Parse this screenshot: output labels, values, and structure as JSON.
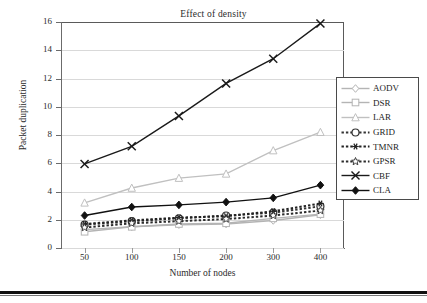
{
  "chart_data": {
    "type": "line",
    "title": "Effect of density",
    "xlabel": "Number of nodes",
    "ylabel": "Packet duplication",
    "categories": [
      "50",
      "100",
      "150",
      "200",
      "300",
      "400"
    ],
    "x_tick_labels": [
      "50",
      "100",
      "150",
      "200",
      "300",
      "400"
    ],
    "y_tick_labels": [
      "0",
      "2",
      "4",
      "6",
      "8",
      "10",
      "12",
      "14",
      "16"
    ],
    "ylim": [
      0,
      16
    ],
    "y_tick_step": 2,
    "grid": "horizontal",
    "legend_position": "right",
    "series": [
      {
        "name": "AODV",
        "values": [
          1.3,
          1.5,
          1.65,
          1.7,
          1.95,
          2.35
        ],
        "marker": "open-diamond",
        "line_style": "solid",
        "color": "#b4b4b4"
      },
      {
        "name": "DSR",
        "values": [
          1.15,
          1.5,
          1.7,
          1.75,
          2.1,
          2.4
        ],
        "marker": "open-square",
        "line_style": "solid",
        "color": "#b4b4b4"
      },
      {
        "name": "LAR",
        "values": [
          3.2,
          4.25,
          4.95,
          5.25,
          6.9,
          8.2
        ],
        "marker": "open-triangle",
        "line_style": "solid",
        "color": "#c0c0c0"
      },
      {
        "name": "GRID",
        "values": [
          1.65,
          1.9,
          2.1,
          2.3,
          2.5,
          2.95
        ],
        "marker": "open-circle",
        "line_style": "dashed",
        "color": "#333333"
      },
      {
        "name": "TMNR",
        "values": [
          1.7,
          1.95,
          2.15,
          2.25,
          2.6,
          3.15
        ],
        "marker": "asterisk",
        "line_style": "dashed",
        "color": "#222222"
      },
      {
        "name": "GPSR",
        "values": [
          1.45,
          1.75,
          1.9,
          2.05,
          2.3,
          2.65
        ],
        "marker": "open-star",
        "line_style": "dashed",
        "color": "#2b2b2b"
      },
      {
        "name": "CBF",
        "values": [
          5.95,
          7.2,
          9.35,
          11.65,
          13.4,
          15.9
        ],
        "marker": "cross-x",
        "line_style": "solid",
        "color": "#1a1a1a"
      },
      {
        "name": "CLA",
        "values": [
          2.3,
          2.9,
          3.05,
          3.25,
          3.55,
          4.45
        ],
        "marker": "filled-diamond",
        "line_style": "solid",
        "color": "#111111"
      }
    ]
  },
  "legend": {
    "items": [
      {
        "label": "AODV"
      },
      {
        "label": "DSR"
      },
      {
        "label": "LAR"
      },
      {
        "label": "GRID"
      },
      {
        "label": "TMNR"
      },
      {
        "label": "GPSR"
      },
      {
        "label": "CBF"
      },
      {
        "label": "CLA"
      }
    ]
  }
}
